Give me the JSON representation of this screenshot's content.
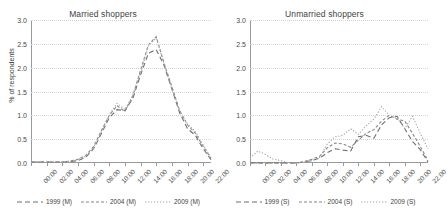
{
  "chart_data": [
    {
      "type": "line",
      "title": "Married shoppers",
      "xlabel": "",
      "ylabel": "% of respondents",
      "ylim": [
        0,
        3.0
      ],
      "yticks": [
        "0.0",
        "0.5",
        "1.0",
        "1.5",
        "2.0",
        "2.5",
        "3.0"
      ],
      "ytick_values": [
        0.0,
        0.5,
        1.0,
        1.5,
        2.0,
        2.5,
        3.0
      ],
      "grid": true,
      "legend_position": "bottom",
      "categories": [
        "00:00",
        "02:00",
        "04:00",
        "06:00",
        "08:00",
        "10:00",
        "12:00",
        "14:00",
        "16:00",
        "18:00",
        "20:00",
        "22:00"
      ],
      "x": [
        0,
        1,
        2,
        3,
        4,
        5,
        6,
        7,
        8,
        9,
        10,
        11,
        12,
        13,
        14,
        15,
        16,
        17,
        18,
        19,
        20,
        21,
        22,
        23
      ],
      "xtick_hours": [
        0,
        2,
        4,
        6,
        8,
        10,
        12,
        14,
        16,
        18,
        20,
        22
      ],
      "series": [
        {
          "name": "1999 (M)",
          "style": "dash",
          "color": "#6f6f6f",
          "values": [
            0.02,
            0.02,
            0.02,
            0.02,
            0.02,
            0.03,
            0.05,
            0.12,
            0.3,
            0.62,
            0.95,
            1.12,
            1.1,
            1.35,
            1.85,
            2.3,
            2.38,
            2.05,
            1.55,
            1.05,
            0.72,
            0.58,
            0.3,
            0.07
          ]
        },
        {
          "name": "2004 (M)",
          "style": "dashed",
          "color": "#888888",
          "values": [
            0.02,
            0.02,
            0.02,
            0.02,
            0.02,
            0.04,
            0.08,
            0.16,
            0.35,
            0.68,
            1.0,
            1.2,
            1.08,
            1.4,
            1.95,
            2.48,
            2.65,
            2.1,
            1.6,
            1.1,
            0.8,
            0.62,
            0.35,
            0.1
          ]
        },
        {
          "name": "2009 (M)",
          "style": "dotted",
          "color": "#a8a8a8",
          "values": [
            0.02,
            0.02,
            0.02,
            0.02,
            0.02,
            0.03,
            0.07,
            0.14,
            0.32,
            0.66,
            1.02,
            1.25,
            1.12,
            1.42,
            1.9,
            2.45,
            2.62,
            2.08,
            1.58,
            1.08,
            0.82,
            0.66,
            0.38,
            0.12
          ]
        }
      ],
      "legend": [
        "1999 (M)",
        "2004 (M)",
        "2009 (M)"
      ]
    },
    {
      "type": "line",
      "title": "Unmarried shoppers",
      "xlabel": "",
      "ylabel": "",
      "ylim": [
        0,
        3.0
      ],
      "yticks": [
        "0.0",
        "0.5",
        "1.0",
        "1.5",
        "2.0",
        "2.5",
        "3.0"
      ],
      "ytick_values": [
        0.0,
        0.5,
        1.0,
        1.5,
        2.0,
        2.5,
        3.0
      ],
      "grid": true,
      "legend_position": "bottom",
      "categories": [
        "00:00",
        "02:00",
        "04:00",
        "06:00",
        "08:00",
        "10:00",
        "12:00",
        "14:00",
        "16:00",
        "18:00",
        "20:00",
        "22:00"
      ],
      "x": [
        0,
        1,
        2,
        3,
        4,
        5,
        6,
        7,
        8,
        9,
        10,
        11,
        12,
        13,
        14,
        15,
        16,
        17,
        18,
        19,
        20,
        21,
        22,
        23
      ],
      "xtick_hours": [
        0,
        2,
        4,
        6,
        8,
        10,
        12,
        14,
        16,
        18,
        20,
        22
      ],
      "series": [
        {
          "name": "1999 (S)",
          "style": "dash",
          "color": "#6f6f6f",
          "values": [
            0.0,
            0.0,
            0.0,
            0.0,
            0.0,
            0.0,
            0.0,
            0.02,
            0.05,
            0.1,
            0.22,
            0.3,
            0.27,
            0.25,
            0.55,
            0.58,
            0.52,
            0.8,
            0.95,
            0.98,
            0.72,
            0.45,
            0.28,
            0.02
          ]
        },
        {
          "name": "2004 (S)",
          "style": "dashed",
          "color": "#888888",
          "values": [
            0.0,
            0.0,
            0.0,
            0.0,
            0.0,
            0.0,
            0.0,
            0.03,
            0.08,
            0.14,
            0.32,
            0.42,
            0.4,
            0.33,
            0.48,
            0.62,
            0.7,
            0.88,
            1.0,
            0.92,
            0.88,
            0.62,
            0.35,
            0.05
          ]
        },
        {
          "name": "2009 (S)",
          "style": "dotted",
          "color": "#a8a8a8",
          "values": [
            0.1,
            0.25,
            0.18,
            0.08,
            0.05,
            0.0,
            0.0,
            0.02,
            0.05,
            0.12,
            0.4,
            0.55,
            0.58,
            0.72,
            0.6,
            0.78,
            0.92,
            1.18,
            1.0,
            0.95,
            0.72,
            0.98,
            0.62,
            0.3
          ]
        }
      ],
      "legend": [
        "1999 (S)",
        "2004 (S)",
        "2009 (S)"
      ]
    }
  ]
}
